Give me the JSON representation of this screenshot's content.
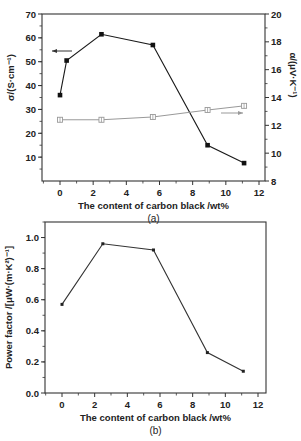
{
  "chart_data": [
    {
      "id": "a",
      "type": "line",
      "panel_label": "(a)",
      "title": "",
      "xlabel": "The content of carbon black /wt%",
      "ylabel": "σ/(S·cm⁻¹)",
      "ylabel_right": "α/(μV·K⁻¹)",
      "xlim": [
        -1,
        12.5
      ],
      "ylim": [
        0,
        70
      ],
      "ylim_right": [
        8,
        20
      ],
      "x_ticks": [
        0,
        2,
        4,
        6,
        8,
        10,
        12
      ],
      "y_ticks": [
        10,
        20,
        30,
        40,
        50,
        60,
        70
      ],
      "y_ticks_right": [
        8,
        10,
        12,
        14,
        16,
        18,
        20
      ],
      "grid": false,
      "series": [
        {
          "name": "σ (electrical conductivity)",
          "axis": "left",
          "marker": "filled-square",
          "color": "#1a1a1a",
          "x": [
            0,
            0.4,
            2.5,
            5.6,
            8.9,
            11.1
          ],
          "values": [
            36,
            50.5,
            61.5,
            57,
            15,
            7.5
          ]
        },
        {
          "name": "α (Seebeck coefficient)",
          "axis": "right",
          "marker": "open-square-cross",
          "color": "#999999",
          "x": [
            0,
            2.5,
            5.6,
            8.9,
            11.1
          ],
          "values": [
            12.4,
            12.4,
            12.6,
            13.1,
            13.4
          ]
        }
      ],
      "annotations": [
        {
          "type": "arrow",
          "direction": "left",
          "points_to": "left-axis",
          "near_series": "σ"
        },
        {
          "type": "arrow",
          "direction": "right",
          "points_to": "right-axis",
          "near_series": "α"
        }
      ]
    },
    {
      "id": "b",
      "type": "line",
      "panel_label": "(b)",
      "title": "",
      "xlabel": "The content of carbon black /wt%",
      "ylabel": "Power factor /[μW·(m·K²)⁻¹]",
      "xlim": [
        -1,
        12.5
      ],
      "ylim": [
        0,
        1.1
      ],
      "x_ticks": [
        0,
        2,
        4,
        6,
        8,
        10,
        12
      ],
      "y_ticks": [
        0.0,
        0.2,
        0.4,
        0.6,
        0.8,
        1.0
      ],
      "y_tick_labels": [
        "0.0",
        "0.2",
        "0.4",
        "0.6",
        "0.8",
        "1.0"
      ],
      "grid": false,
      "series": [
        {
          "name": "Power factor",
          "marker": "small-filled-square",
          "color": "#333333",
          "x": [
            0,
            2.5,
            5.6,
            8.9,
            11.1
          ],
          "values": [
            0.57,
            0.96,
            0.92,
            0.26,
            0.14
          ]
        }
      ]
    }
  ]
}
